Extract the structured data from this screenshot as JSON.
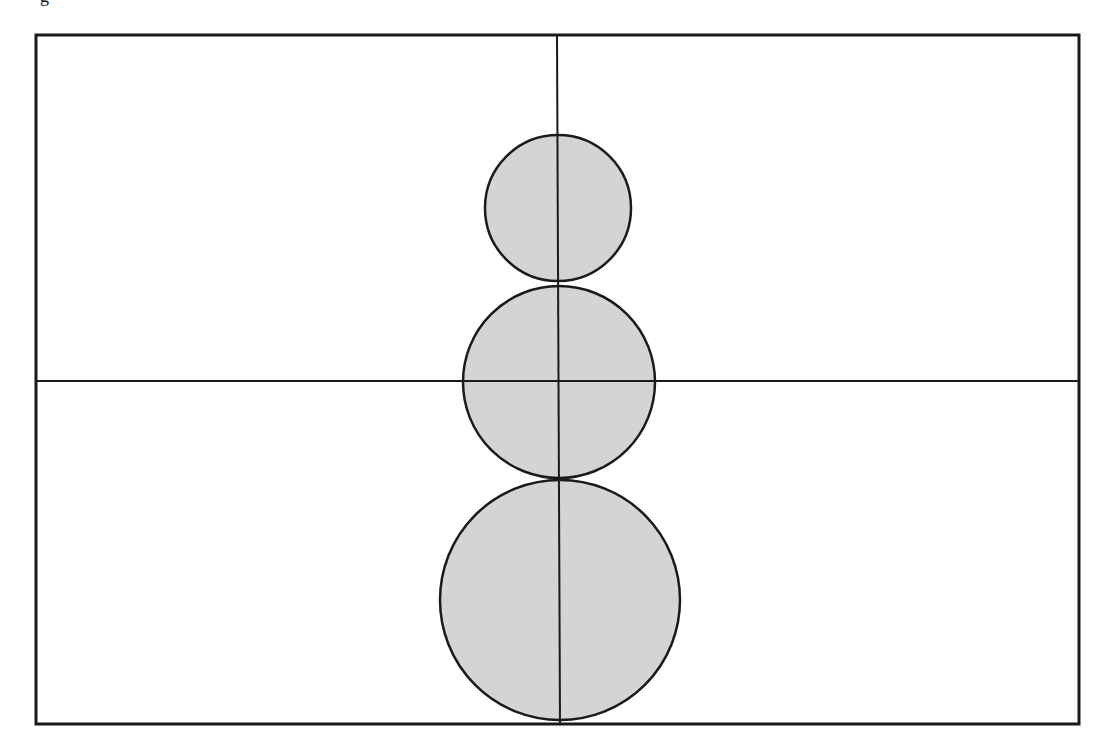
{
  "figure": {
    "type": "geometric-diagram",
    "cropped_caption_fragment": "g",
    "colors": {
      "background": "#ffffff",
      "stroke": "#1a1a1a",
      "circle_fill": "#d4d4d4"
    },
    "frame": {
      "x": 36,
      "y": 35,
      "width": 1043,
      "height": 689,
      "stroke_width": 3
    },
    "axes": {
      "vertical": {
        "x1": 557,
        "y1": 35,
        "x2": 560,
        "y2": 724,
        "stroke_width": 2
      },
      "horizontal": {
        "x1": 36,
        "y1": 381,
        "x2": 1079,
        "y2": 381,
        "stroke_width": 2
      }
    },
    "circles": [
      {
        "name": "top-circle",
        "cx": 558,
        "cy": 208,
        "r": 73,
        "label": "small"
      },
      {
        "name": "middle-circle",
        "cx": 559,
        "cy": 382,
        "r": 96,
        "label": "medium"
      },
      {
        "name": "bottom-circle",
        "cx": 560,
        "cy": 600,
        "r": 120,
        "label": "large"
      }
    ]
  }
}
